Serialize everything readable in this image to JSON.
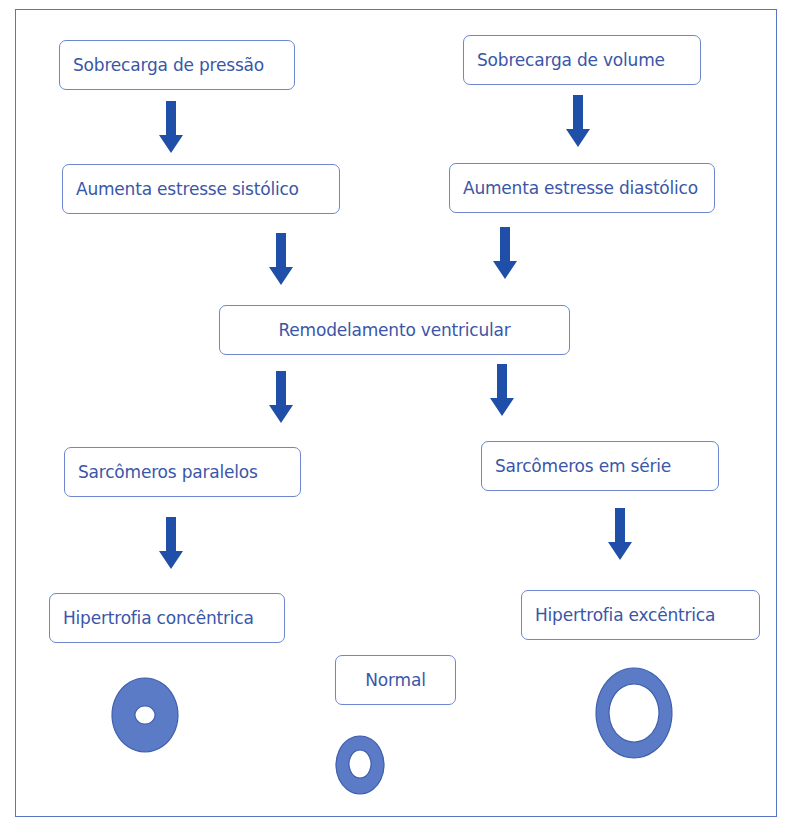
{
  "diagram": {
    "colors": {
      "frame": "#5a73c2",
      "box_border": "#6d86cc",
      "text": "#3a56a8",
      "arrow": "#1f4fa8",
      "ring_fill": "#5b7bc6",
      "ring_stroke": "#3f5fae"
    },
    "nodes": {
      "pressure_overload": "Sobrecarga de pressão",
      "volume_overload": "Sobrecarga de volume",
      "systolic_stress": "Aumenta estresse sistólico",
      "diastolic_stress": "Aumenta estresse diastólico",
      "remodeling": "Remodelamento ventricular",
      "parallel_sarcomeres": "Sarcômeros paralelos",
      "series_sarcomeres": "Sarcômeros em série",
      "concentric_hypertrophy": "Hipertrofia concêntrica",
      "eccentric_hypertrophy": "Hipertrofia excêntrica",
      "normal": "Normal"
    },
    "edges": [
      {
        "from": "pressure_overload",
        "to": "systolic_stress"
      },
      {
        "from": "volume_overload",
        "to": "diastolic_stress"
      },
      {
        "from": "systolic_stress",
        "to": "remodeling"
      },
      {
        "from": "diastolic_stress",
        "to": "remodeling"
      },
      {
        "from": "remodeling",
        "to": "parallel_sarcomeres"
      },
      {
        "from": "remodeling",
        "to": "series_sarcomeres"
      },
      {
        "from": "parallel_sarcomeres",
        "to": "concentric_hypertrophy"
      },
      {
        "from": "series_sarcomeres",
        "to": "eccentric_hypertrophy"
      }
    ],
    "rings": [
      {
        "name": "concentric",
        "description": "thick wall, small cavity"
      },
      {
        "name": "normal",
        "description": "normal wall, normal cavity"
      },
      {
        "name": "eccentric",
        "description": "thin wall, large cavity"
      }
    ]
  }
}
